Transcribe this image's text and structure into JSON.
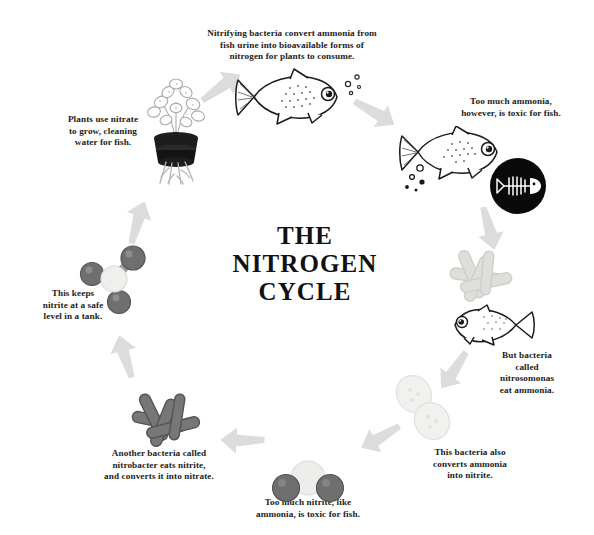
{
  "title": {
    "line1": "THE",
    "line2": "NITROGEN",
    "line3": "CYCLE",
    "full": "THE\nNITROGEN\nCYCLE"
  },
  "colors": {
    "background": "#ffffff",
    "text": "#1c1c1c",
    "arrow": "#dcdcdc",
    "ink_dark": "#1a1a1a",
    "bacteria_light": "#d7d7d3",
    "bacteria_mid": "#c9c9c4",
    "bacteria_dark": "#6f6f6f",
    "molecule_dark": "#6b6b6b",
    "molecule_light": "#ececec",
    "cell_pale": "#eeeeec"
  },
  "steps": [
    {
      "id": "nitrifying-bacteria",
      "caption": "Nitrifying bacteria convert ammonia from\nfish urine into bioavailable forms of\nnitrogen for plants to consume.",
      "art": "fish-right-with-bubbles"
    },
    {
      "id": "ammonia-toxic",
      "caption": "Too much ammonia,\nhowever, is toxic for fish.",
      "art": "fish-right-with-bubbles-and-skeleton-badge"
    },
    {
      "id": "nitrosomonas",
      "caption": "But bacteria\ncalled\nnitrosomonas\neat ammonia.",
      "art": "pale-rod-bacteria-and-fish-left"
    },
    {
      "id": "converts-to-nitrite",
      "caption": "This bacteria also\nconverts ammonia\ninto nitrite.",
      "art": "dividing-cell"
    },
    {
      "id": "nitrite-toxic",
      "caption": "Too much nitrite, like\nammonia, is toxic for fish.",
      "art": "nitrite-molecule"
    },
    {
      "id": "nitrobacter",
      "caption": "Another bacteria called\nnitrobacter eats nitrite,\nand converts it into nitrate.",
      "art": "dark-rod-bacteria"
    },
    {
      "id": "safe-nitrite-level",
      "caption": "This keeps\nnitrite at a safe\nlevel in a tank.",
      "art": "nitrate-molecule"
    },
    {
      "id": "plants-use-nitrate",
      "caption": "Plants use nitrate\nto grow, cleaning\nwater for fish.",
      "art": "potted-plant-with-roots"
    }
  ],
  "arrows": [
    {
      "id": "arrow-plant-to-fish",
      "from": "plants-use-nitrate",
      "to": "nitrifying-bacteria"
    },
    {
      "id": "arrow-fish-to-toxic",
      "from": "nitrifying-bacteria",
      "to": "ammonia-toxic"
    },
    {
      "id": "arrow-toxic-to-nitrosomonas",
      "from": "ammonia-toxic",
      "to": "nitrosomonas"
    },
    {
      "id": "arrow-nitrosomonas-to-nitrite",
      "from": "nitrosomonas",
      "to": "converts-to-nitrite"
    },
    {
      "id": "arrow-nitrite-to-toxic-nitrite",
      "from": "converts-to-nitrite",
      "to": "nitrite-toxic"
    },
    {
      "id": "arrow-toxic-nitrite-to-nitrobacter",
      "from": "nitrite-toxic",
      "to": "nitrobacter"
    },
    {
      "id": "arrow-nitrobacter-to-nitrate",
      "from": "nitrobacter",
      "to": "safe-nitrite-level"
    },
    {
      "id": "arrow-nitrate-to-plant",
      "from": "safe-nitrite-level",
      "to": "plants-use-nitrate"
    }
  ]
}
